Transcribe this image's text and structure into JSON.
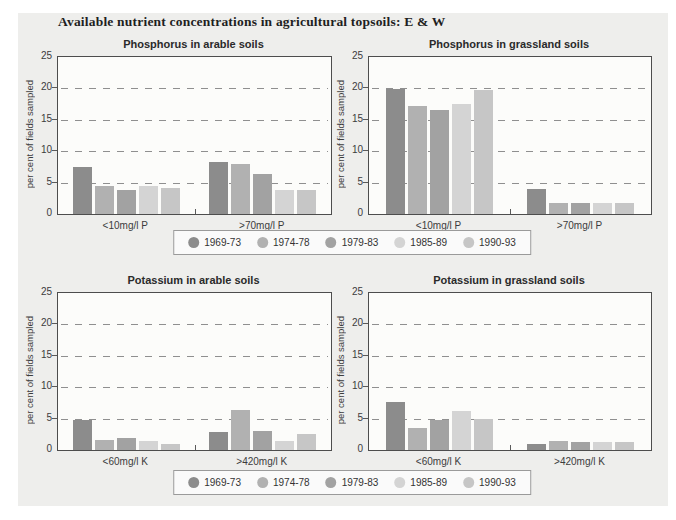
{
  "page": {
    "title": "Available nutrient concentrations in agricultural topsoils: E & W",
    "panel_color": "#eeeeec",
    "plot_bg": "#fcfcfa",
    "axis_color": "#4d4d4d",
    "grid_color": "#8f8f8f"
  },
  "legend": {
    "position": "below each row of charts, centered",
    "entries": [
      {
        "label": "1969-73",
        "color": "#8c8c8c"
      },
      {
        "label": "1974-78",
        "color": "#b1b1b1"
      },
      {
        "label": "1979-83",
        "color": "#a2a2a2"
      },
      {
        "label": "1985-89",
        "color": "#d4d4d4"
      },
      {
        "label": "1990-93",
        "color": "#c6c6c6"
      }
    ]
  },
  "chart_data": [
    {
      "type": "bar",
      "title": "Phosphorus in arable soils",
      "ylabel": "per cent of fields sampled",
      "xlabel": "",
      "ylim": [
        0,
        25
      ],
      "yticks": [
        0,
        5,
        10,
        15,
        20,
        25
      ],
      "grid": "horizontal dashed at 5,10,15,20",
      "categories": [
        "<10mg/l P",
        ">70mg/l P"
      ],
      "series": [
        {
          "name": "1969-73",
          "values": [
            7.5,
            8.3
          ]
        },
        {
          "name": "1974-78",
          "values": [
            4.5,
            7.9
          ]
        },
        {
          "name": "1979-83",
          "values": [
            3.8,
            6.3
          ]
        },
        {
          "name": "1985-89",
          "values": [
            4.4,
            3.9
          ]
        },
        {
          "name": "1990-93",
          "values": [
            4.1,
            3.8
          ]
        }
      ]
    },
    {
      "type": "bar",
      "title": "Phosphorus in grassland soils",
      "ylabel": "per cent of fields sampled",
      "xlabel": "",
      "ylim": [
        0,
        25
      ],
      "yticks": [
        0,
        5,
        10,
        15,
        20,
        25
      ],
      "grid": "horizontal dashed at 5,10,15,20",
      "categories": [
        "<10mg/l P",
        ">70mg/l P"
      ],
      "series": [
        {
          "name": "1969-73",
          "values": [
            19.9,
            4.0
          ]
        },
        {
          "name": "1974-78",
          "values": [
            17.2,
            1.7
          ]
        },
        {
          "name": "1979-83",
          "values": [
            16.6,
            1.8
          ]
        },
        {
          "name": "1985-89",
          "values": [
            17.5,
            1.7
          ]
        },
        {
          "name": "1990-93",
          "values": [
            19.7,
            1.7
          ]
        }
      ]
    },
    {
      "type": "bar",
      "title": "Potassium in arable soils",
      "ylabel": "per cent of fields sampled",
      "xlabel": "",
      "ylim": [
        0,
        25
      ],
      "yticks": [
        0,
        5,
        10,
        15,
        20,
        25
      ],
      "grid": "horizontal dashed at 5,10,15,20",
      "categories": [
        "<60mg/l K",
        ">420mg/l K"
      ],
      "series": [
        {
          "name": "1969-73",
          "values": [
            4.8,
            2.9
          ]
        },
        {
          "name": "1974-78",
          "values": [
            1.6,
            6.4
          ]
        },
        {
          "name": "1979-83",
          "values": [
            1.9,
            3.1
          ]
        },
        {
          "name": "1985-89",
          "values": [
            1.5,
            1.4
          ]
        },
        {
          "name": "1990-93",
          "values": [
            0.9,
            2.6
          ]
        }
      ]
    },
    {
      "type": "bar",
      "title": "Potassium in grassland soils",
      "ylabel": "per cent of fields sampled",
      "xlabel": "",
      "ylim": [
        0,
        25
      ],
      "yticks": [
        0,
        5,
        10,
        15,
        20,
        25
      ],
      "grid": "horizontal dashed at 5,10,15,20",
      "categories": [
        "<60mg/l K",
        ">420mg/l K"
      ],
      "series": [
        {
          "name": "1969-73",
          "values": [
            7.6,
            0.9
          ]
        },
        {
          "name": "1974-78",
          "values": [
            3.5,
            1.4
          ]
        },
        {
          "name": "1979-83",
          "values": [
            4.7,
            1.3
          ]
        },
        {
          "name": "1985-89",
          "values": [
            6.2,
            1.2
          ]
        },
        {
          "name": "1990-93",
          "values": [
            5.0,
            1.3
          ]
        }
      ]
    }
  ]
}
